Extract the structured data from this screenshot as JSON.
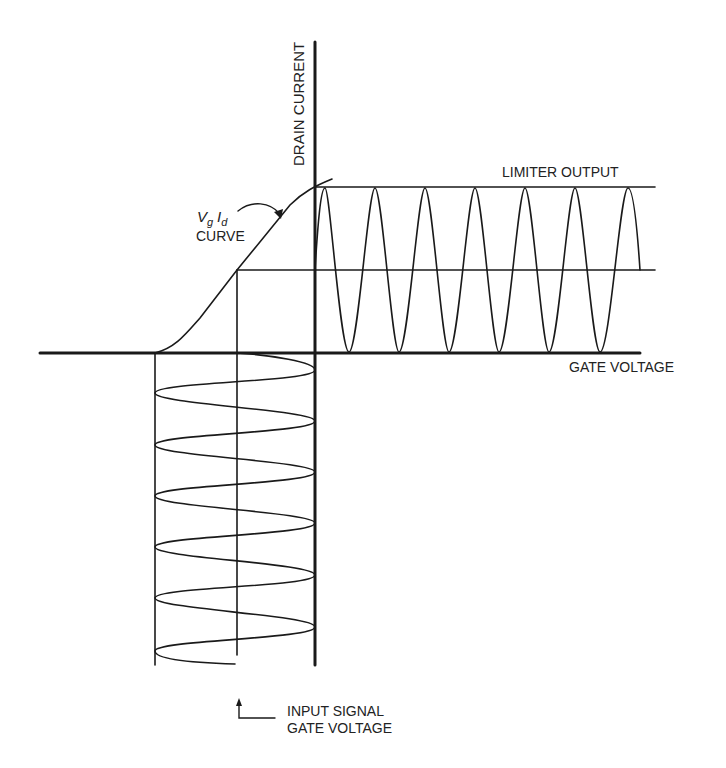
{
  "diagram": {
    "axes": {
      "vertical_label": "DRAIN CURRENT",
      "horizontal_label": "GATE VOLTAGE"
    },
    "curve_label": {
      "symbol_v": "V",
      "symbol_v_sub": "g",
      "symbol_i": "I",
      "symbol_i_sub": "d",
      "word": "CURVE"
    },
    "output_label": "LIMITER OUTPUT",
    "input_label_line1": "INPUT SIGNAL",
    "input_label_line2": "GATE VOLTAGE",
    "colors": {
      "stroke": "#1a1a1a",
      "background": "#ffffff",
      "text": "#222222"
    }
  }
}
